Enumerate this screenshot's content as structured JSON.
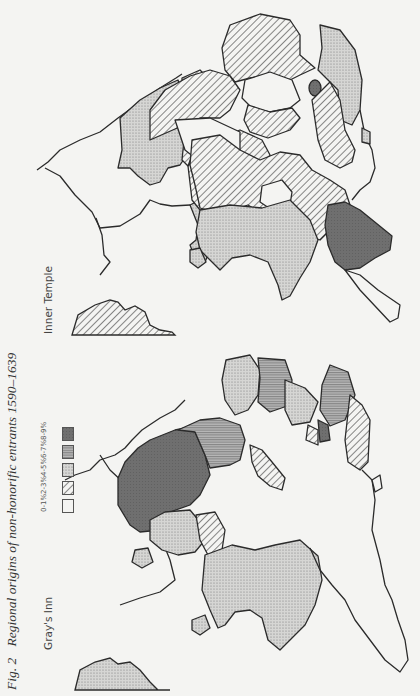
{
  "figure": {
    "number": "Fig. 2",
    "caption": "Regional origins of non-honorific entrants 1590–1639",
    "orientation": "rotated 90° counter-clockwise"
  },
  "maps": [
    {
      "id": "grays-inn",
      "label": "Gray's Inn",
      "position": "lower half"
    },
    {
      "id": "inner-temple",
      "label": "Inner Temple",
      "position": "upper half"
    }
  ],
  "legend": {
    "items": [
      {
        "label": "8-9%",
        "pattern": "solid-dark",
        "color": "#6e6e6e"
      },
      {
        "label": "6-7%",
        "pattern": "horizontal-lines",
        "color": "#9a9a9a"
      },
      {
        "label": "4-5%",
        "pattern": "stipple",
        "color": "#c8c8c8"
      },
      {
        "label": "2-3%",
        "pattern": "diagonal-hatch",
        "color": "#555555"
      },
      {
        "label": "0-1%",
        "pattern": "blank",
        "color": "#f4f4f2"
      }
    ]
  },
  "colors": {
    "paper": "#f4f4f2",
    "outline": "#2b2b2b",
    "text": "#333333"
  }
}
